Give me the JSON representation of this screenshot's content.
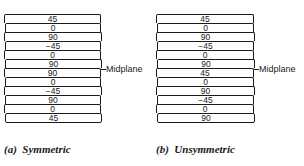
{
  "figure": {
    "symmetric": {
      "caption": "(a)  Symmetric",
      "plies": [
        "45",
        "0",
        "90",
        "−45",
        "0",
        "90",
        "90",
        "0",
        "−45",
        "90",
        "0",
        "45"
      ],
      "midplane_label": "Midplane"
    },
    "unsymmetric": {
      "caption": "(b)  Unsymmetric",
      "plies": [
        "45",
        "0",
        "90",
        "−45",
        "0",
        "90",
        "45",
        "0",
        "90",
        "−45",
        "0",
        "90"
      ],
      "midplane_label": "Midplane"
    }
  }
}
